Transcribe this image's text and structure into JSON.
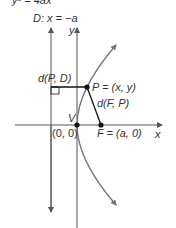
{
  "equation": "y² = 4ax",
  "directrix_label": "D: x = −a",
  "axis_labels": {
    "x": "x",
    "y": "y"
  },
  "point_P_label": "P = (x, y)",
  "distance_PD_label": "d(P, D)",
  "distance_FP_label": "d(F, P)",
  "vertex_label": "V",
  "vertex_coords": "(0, 0)",
  "focus_label": "F = (a, 0)",
  "colors": {
    "curve": "#777777",
    "axes": "#555555",
    "segments": "#111111"
  }
}
